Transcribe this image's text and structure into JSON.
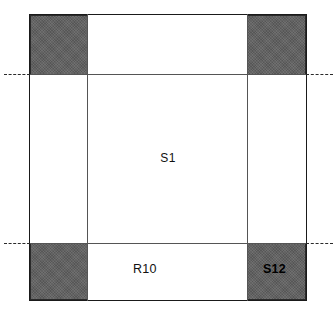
{
  "diagram": {
    "type": "engineering-cross-section",
    "canvas": {
      "width": 336,
      "height": 314
    },
    "colors": {
      "background": "#ffffff",
      "outline": "#1a1a1a",
      "shaded_block_fill": "#5f5f5f",
      "construction_line": "#555555",
      "centerline": "#2a2a2a",
      "label_text": "#111111"
    },
    "outer_frame": {
      "name": "section-outline",
      "x": 29,
      "y": 14,
      "width": 278,
      "height": 287
    },
    "shaded_blocks": [
      {
        "position": "top-left",
        "x": 30,
        "y": 15,
        "width": 58,
        "height": 60
      },
      {
        "position": "top-right",
        "x": 247,
        "y": 15,
        "width": 59,
        "height": 60
      },
      {
        "position": "bottom-left",
        "x": 30,
        "y": 243,
        "width": 58,
        "height": 57
      },
      {
        "position": "bottom-right",
        "x": 247,
        "y": 243,
        "width": 59,
        "height": 57
      }
    ],
    "construction_lines": [
      {
        "orientation": "vertical",
        "position": 87
      },
      {
        "orientation": "vertical",
        "position": 247
      },
      {
        "orientation": "horizontal",
        "position": 74
      },
      {
        "orientation": "horizontal",
        "position": 243
      }
    ],
    "centerlines": [
      {
        "side": "left",
        "y": 74
      },
      {
        "side": "right",
        "y": 74
      },
      {
        "side": "left",
        "y": 243
      },
      {
        "side": "right",
        "y": 243
      }
    ],
    "labels": {
      "center_region": "S1",
      "lower_band": "R10",
      "corner_block": "S12"
    }
  }
}
